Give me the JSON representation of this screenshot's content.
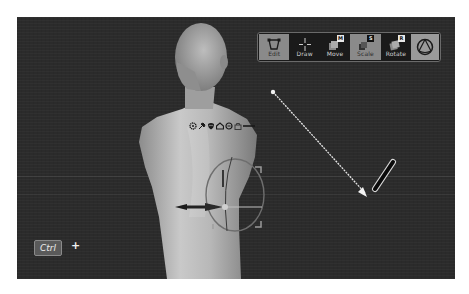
{
  "viewport": {
    "background_color": "#2b2b2b"
  },
  "toolbar": {
    "tools": [
      {
        "id": "edit",
        "label": "Edit",
        "icon": "edit-frame-icon",
        "active": true,
        "key": ""
      },
      {
        "id": "draw",
        "label": "Draw",
        "icon": "crosshair-icon",
        "active": false,
        "key": ""
      },
      {
        "id": "move",
        "label": "Move",
        "icon": "move-icon",
        "active": false,
        "key": "M"
      },
      {
        "id": "scale",
        "label": "Scale",
        "icon": "scale-icon",
        "active": true,
        "key": "S"
      },
      {
        "id": "rotate",
        "label": "Rotate",
        "icon": "rotate-icon",
        "active": false,
        "key": "R"
      },
      {
        "id": "sphere",
        "label": "",
        "icon": "sphere-gizmo-icon",
        "active": true,
        "key": ""
      }
    ]
  },
  "gizmo": {
    "icons": [
      "gear-icon",
      "pin-icon",
      "mask-icon",
      "house-icon",
      "reset-icon",
      "lock-icon",
      "link-icon"
    ]
  },
  "hint": {
    "key_label": "Ctrl",
    "plus": "+"
  },
  "accent_color": "#8a8a8a"
}
